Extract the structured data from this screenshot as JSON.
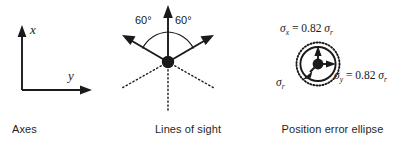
{
  "figure": {
    "background_color": "#ffffff",
    "ink_color": "#1a1a1a"
  },
  "panels": [
    {
      "id": "axes",
      "caption": "Axes",
      "axis_labels": {
        "vertical": "x",
        "horizontal": "y"
      },
      "description": "L-shaped coordinate frame with x pointing up and y pointing right"
    },
    {
      "id": "lines_of_sight",
      "caption": "Lines of sight",
      "angles": [
        {
          "label": "60°",
          "position": "left"
        },
        {
          "label": "60°",
          "position": "right"
        }
      ],
      "ray_count": 3,
      "solid_ray_bearings_deg": [
        150,
        90,
        30
      ],
      "dotted_ray_bearings_deg": [
        210,
        270,
        330
      ],
      "description": "Three solid arrows separated by 60 degrees with dotted continuations below the station point"
    },
    {
      "id": "position_error_ellipse",
      "caption": "Position error ellipse",
      "equations": {
        "sigma_x": {
          "symbol": "σ",
          "subscript": "x",
          "relation": "=",
          "coefficient": "0.82",
          "reference_symbol": "σ",
          "reference_subscript": "r",
          "full": "σx = 0.82 σr"
        },
        "sigma_y": {
          "symbol": "σ",
          "subscript": "y",
          "relation": "=",
          "coefficient": "0.82",
          "reference_symbol": "σ",
          "reference_subscript": "r",
          "full": "σy = 0.82 σr"
        },
        "sigma_r": {
          "symbol": "σ",
          "subscript": "r",
          "full": "σr"
        }
      },
      "description": "Dotted reference circle of radius sigma_r enclosing a solid error ellipse with arrows to the semi axes"
    }
  ]
}
